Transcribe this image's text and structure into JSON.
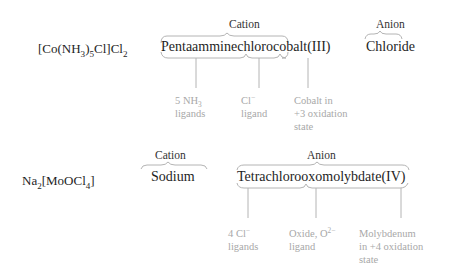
{
  "colors": {
    "text": "#1e1e1e",
    "note_text": "#a8a8a8",
    "brace_line": "#b4b4b4"
  },
  "examples": [
    {
      "formula": {
        "main": "[Co(NH",
        "sub1": "3",
        "mid": ")",
        "sub2": "5",
        "end": "Cl]Cl",
        "sub3": "2"
      },
      "cation": {
        "label": "Cation",
        "name": "Pentaamminechlorocobalt(III)"
      },
      "anion": {
        "label": "Anion",
        "name": "Chloride"
      },
      "notes": [
        {
          "line1": "5 NH",
          "line1_sub": "3",
          "line2": "ligands"
        },
        {
          "line1": "Cl",
          "line1_sup": "−",
          "line2": "ligand"
        },
        {
          "line1": "Cobalt in",
          "line2": "+3 oxidation",
          "line3": "state"
        }
      ]
    },
    {
      "formula": {
        "main": "Na",
        "sub1": "2",
        "mid": "[MoOCl",
        "sub2": "4",
        "end": "]"
      },
      "cation": {
        "label": "Cation",
        "name": "Sodium"
      },
      "anion": {
        "label": "Anion",
        "name": "Tetrachlorooxomolybdate(IV)"
      },
      "notes": [
        {
          "line1": "4 Cl",
          "line1_sup": "−",
          "line2": "ligands"
        },
        {
          "line1": "Oxide, O",
          "line1_sup": "2−",
          "line2": "ligand"
        },
        {
          "line1": "Molybdenum",
          "line2": "in +4 oxidation",
          "line3": "state"
        }
      ]
    }
  ]
}
